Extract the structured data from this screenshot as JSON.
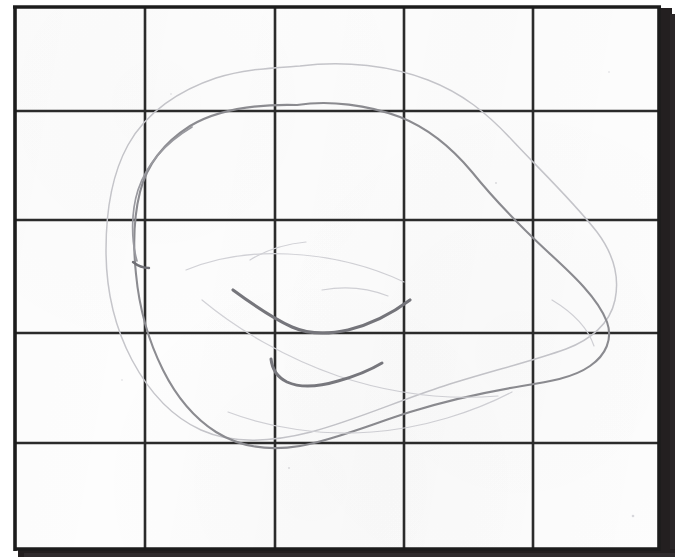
{
  "document": {
    "kind": "scanned-hand-drawing",
    "medium": "pencil on graph paper",
    "title": "Hand-drawn blob outline on grid paper",
    "background_color": "#ffffff",
    "paper_color": "#fdfdfd"
  },
  "grid": {
    "columns": 5,
    "rows": 5,
    "line_color": "#2b2b2b",
    "line_width": 3,
    "border_color": "#1c1c1c",
    "border_width": 4,
    "shadow_color": "#231f20",
    "vertical_line_x": [
      14,
      145,
      275,
      404,
      533,
      660
    ],
    "horizontal_line_y": [
      6,
      111,
      220,
      333,
      443,
      550
    ],
    "cell_width": 130,
    "cell_height": 109
  },
  "drawing": {
    "stroke_color_main": "#8d8d92",
    "stroke_color_faint": "#c3c3c8",
    "stroke_color_dark": "#6b6b70",
    "shapes": [
      {
        "name": "outer-blob-outline",
        "kind": "closed-curve",
        "weight": "faint",
        "description": "large faint outer contour of an irregular oval blob"
      },
      {
        "name": "inner-blob-outline",
        "kind": "closed-curve",
        "weight": "main",
        "description": "darker primary contour of the blob, roughly parallel and inside the outer one"
      },
      {
        "name": "upper-interior-stroke",
        "kind": "open-curve",
        "weight": "dark",
        "description": "short descending stroke meeting a rising curve, forming a shallow V near the middle"
      },
      {
        "name": "lower-interior-stroke",
        "kind": "open-curve",
        "weight": "dark",
        "description": "small hook stroke opening into a shallow smile curve below the upper stroke"
      },
      {
        "name": "faint-interior-echo",
        "kind": "open-curve",
        "weight": "faint",
        "description": "very light erased-looking guide lines echoing the blob interior"
      }
    ]
  },
  "shadow": {
    "right_edge_x": 660,
    "right_edge_width": 12,
    "bottom_edge_y": 549,
    "bottom_edge_height": 8
  }
}
